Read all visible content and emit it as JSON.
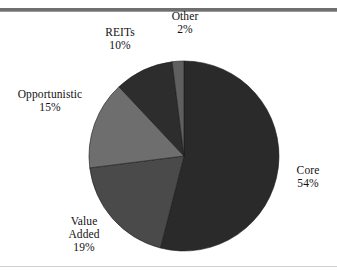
{
  "figure": {
    "name": "real-estate-allocation-pie",
    "background_color": "#ffffff",
    "rule_top_color": "#6f6f6f",
    "rule_bottom_color": "#cfcfcf"
  },
  "chart_data": {
    "type": "pie",
    "title": "",
    "xlabel": "",
    "ylabel": "",
    "legend_position": "none",
    "grid": false,
    "units": "percent",
    "start_angle_deg": 0,
    "direction": "clockwise",
    "center": {
      "x": 184,
      "y": 156
    },
    "radius": 95,
    "total": 100,
    "categories": [
      "Core",
      "Value Added",
      "Opportunistic",
      "REITs",
      "Other"
    ],
    "values": [
      54,
      19,
      15,
      10,
      2
    ],
    "value_labels": [
      "54%",
      "19%",
      "15%",
      "10%",
      "2%"
    ],
    "colors": [
      "#2a2a2a",
      "#4a4a4a",
      "#6e6e6e",
      "#2d2d2d",
      "#5f5f5f"
    ],
    "slices": [
      {
        "label": "Core",
        "value": 54,
        "value_label": "54%",
        "color": "#2a2a2a",
        "start_deg": 0,
        "end_deg": 194.4,
        "label_position": "right"
      },
      {
        "label": "Value Added",
        "label_line1": "Value",
        "label_line2": "Added",
        "value": 19,
        "value_label": "19%",
        "color": "#4a4a4a",
        "start_deg": 194.4,
        "end_deg": 262.8,
        "label_position": "bottom-left"
      },
      {
        "label": "Opportunistic",
        "value": 15,
        "value_label": "15%",
        "color": "#6e6e6e",
        "start_deg": 262.8,
        "end_deg": 316.8,
        "label_position": "left"
      },
      {
        "label": "REITs",
        "value": 10,
        "value_label": "10%",
        "color": "#2d2d2d",
        "start_deg": 316.8,
        "end_deg": 352.8,
        "label_position": "top-left"
      },
      {
        "label": "Other",
        "value": 2,
        "value_label": "2%",
        "color": "#5f5f5f",
        "start_deg": 352.8,
        "end_deg": 360,
        "label_position": "top"
      }
    ]
  }
}
